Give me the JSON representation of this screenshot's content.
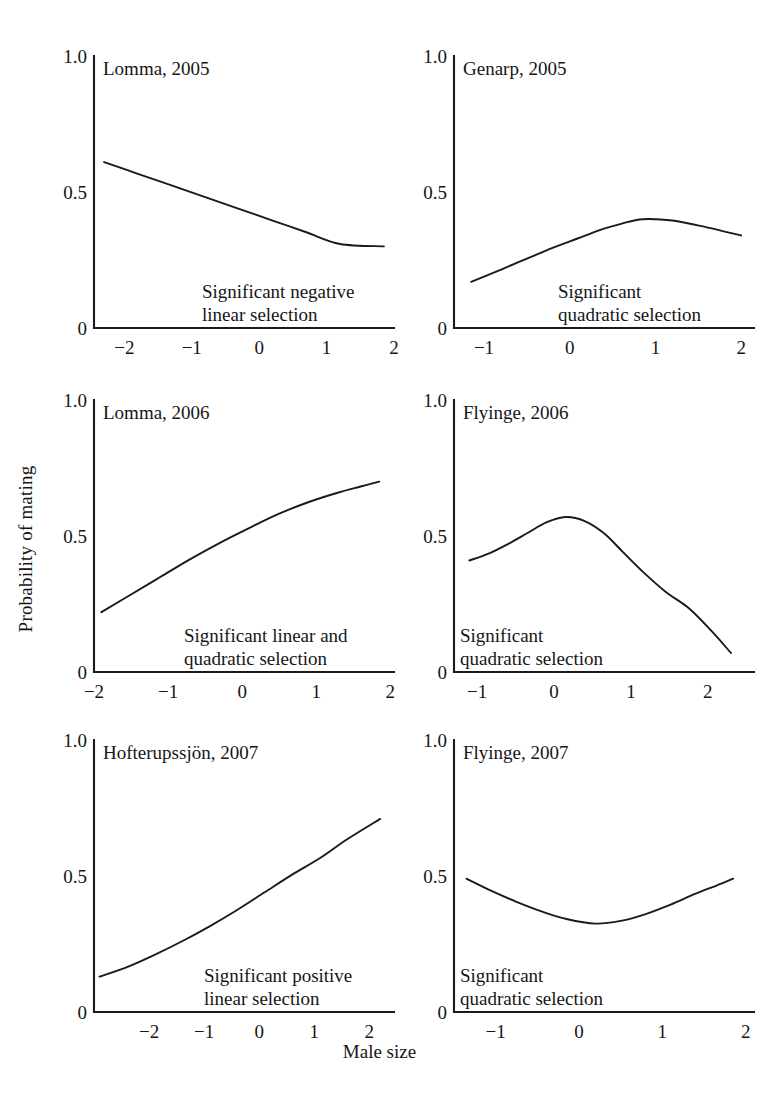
{
  "figure": {
    "y_axis_label": "Probability of mating",
    "x_axis_label": "Male size",
    "line_color": "#1a1a1a",
    "background_color": "#ffffff"
  },
  "chart_data": [
    {
      "type": "line",
      "title": "Lomma, 2005",
      "panel_index": 1,
      "xlabel": "Male size",
      "ylabel": "Probability of mating",
      "xlim": [
        -2.45,
        2.0
      ],
      "ylim": [
        0,
        1.0
      ],
      "xticks": [
        -2,
        -1,
        0,
        1,
        2
      ],
      "xtick_labels": [
        "−2",
        "−1",
        "0",
        "1",
        "2"
      ],
      "yticks": [
        0,
        0.5,
        1.0
      ],
      "ytick_labels": [
        "0",
        "0.5",
        "1.0"
      ],
      "grid": false,
      "legend": "none",
      "annotation": [
        "Significant negative",
        "linear selection"
      ],
      "annotation_align": "left",
      "series": [
        {
          "name": "Probability of mating",
          "x": [
            -2.3,
            -1.8,
            -1.3,
            -0.8,
            -0.3,
            0.2,
            0.7,
            1.2,
            1.85
          ],
          "y": [
            0.61,
            0.567,
            0.524,
            0.481,
            0.438,
            0.395,
            0.352,
            0.309,
            0.3
          ]
        }
      ]
    },
    {
      "type": "line",
      "title": "Genarp, 2005",
      "panel_index": 2,
      "xlabel": "Male size",
      "ylabel": "Probability of mating",
      "xlim": [
        -1.35,
        2.15
      ],
      "ylim": [
        0,
        1.0
      ],
      "xticks": [
        -1,
        0,
        1,
        2
      ],
      "xtick_labels": [
        "−1",
        "0",
        "1",
        "2"
      ],
      "yticks": [
        0,
        0.5,
        1.0
      ],
      "ytick_labels": [
        "0",
        "0.5",
        "1.0"
      ],
      "grid": false,
      "legend": "none",
      "annotation": [
        "Significant",
        "quadratic selection"
      ],
      "annotation_align": "left",
      "series": [
        {
          "name": "Probability of mating",
          "x": [
            -1.15,
            -0.8,
            -0.5,
            -0.2,
            0.1,
            0.4,
            0.6,
            0.85,
            1.2,
            1.6,
            2.0
          ],
          "y": [
            0.17,
            0.215,
            0.255,
            0.295,
            0.33,
            0.365,
            0.383,
            0.4,
            0.395,
            0.37,
            0.34
          ]
        }
      ]
    },
    {
      "type": "line",
      "title": "Lomma, 2006",
      "panel_index": 3,
      "xlabel": "Male size",
      "ylabel": "Probability of mating",
      "xlim": [
        -2.0,
        2.05
      ],
      "ylim": [
        0,
        1.0
      ],
      "xticks": [
        -2,
        -1,
        0,
        1,
        2
      ],
      "xtick_labels": [
        "−2",
        "−1",
        "0",
        "1",
        "2"
      ],
      "yticks": [
        0,
        0.5,
        1.0
      ],
      "ytick_labels": [
        "0",
        "0.5",
        "1.0"
      ],
      "grid": false,
      "legend": "none",
      "annotation": [
        "Significant linear and",
        "quadratic selection"
      ],
      "annotation_align": "left",
      "series": [
        {
          "name": "Probability of mating",
          "x": [
            -1.9,
            -1.5,
            -1.1,
            -0.7,
            -0.3,
            0.1,
            0.5,
            0.9,
            1.3,
            1.6,
            1.85
          ],
          "y": [
            0.22,
            0.285,
            0.35,
            0.415,
            0.475,
            0.53,
            0.582,
            0.625,
            0.66,
            0.682,
            0.7
          ]
        }
      ]
    },
    {
      "type": "line",
      "title": "Flyinge, 2006",
      "panel_index": 4,
      "xlabel": "Male size",
      "ylabel": "Probability of mating",
      "xlim": [
        -1.3,
        2.6
      ],
      "ylim": [
        0,
        1.0
      ],
      "xticks": [
        -1,
        0,
        1,
        2
      ],
      "xtick_labels": [
        "−1",
        "0",
        "1",
        "2"
      ],
      "yticks": [
        0,
        0.5,
        1.0
      ],
      "ytick_labels": [
        "0",
        "0.5",
        "1.0"
      ],
      "grid": false,
      "legend": "none",
      "annotation": [
        "Significant",
        "quadratic selection"
      ],
      "annotation_align": "left",
      "series": [
        {
          "name": "Probability of mating",
          "x": [
            -1.1,
            -0.85,
            -0.6,
            -0.35,
            -0.1,
            0.15,
            0.4,
            0.65,
            0.9,
            1.15,
            1.45,
            1.75,
            2.05,
            2.3
          ],
          "y": [
            0.41,
            0.435,
            0.47,
            0.51,
            0.55,
            0.57,
            0.555,
            0.51,
            0.44,
            0.37,
            0.295,
            0.235,
            0.15,
            0.07
          ]
        }
      ]
    },
    {
      "type": "line",
      "title": "Hofterupssjön, 2007",
      "panel_index": 5,
      "xlabel": "Male size",
      "ylabel": "Probability of mating",
      "xlim": [
        -3.0,
        2.45
      ],
      "ylim": [
        0,
        1.0
      ],
      "xticks": [
        -2,
        -1,
        0,
        1,
        2
      ],
      "xtick_labels": [
        "−2",
        "−1",
        "0",
        "1",
        "2"
      ],
      "yticks": [
        0,
        0.5,
        1.0
      ],
      "ytick_labels": [
        "0",
        "0.5",
        "1.0"
      ],
      "grid": false,
      "legend": "none",
      "annotation": [
        "Significant positive",
        "linear selection"
      ],
      "annotation_align": "left",
      "series": [
        {
          "name": "Probability of mating",
          "x": [
            -2.9,
            -2.4,
            -1.9,
            -1.4,
            -0.9,
            -0.4,
            0.1,
            0.6,
            1.1,
            1.6,
            2.2
          ],
          "y": [
            0.13,
            0.165,
            0.21,
            0.26,
            0.315,
            0.375,
            0.44,
            0.505,
            0.565,
            0.635,
            0.71
          ]
        }
      ]
    },
    {
      "type": "line",
      "title": "Flyinge, 2007",
      "panel_index": 6,
      "xlabel": "Male size",
      "ylabel": "Probability of mating",
      "xlim": [
        -1.5,
        2.1
      ],
      "ylim": [
        0,
        1.0
      ],
      "xticks": [
        -1,
        0,
        1,
        2
      ],
      "xtick_labels": [
        "−1",
        "0",
        "1",
        "2"
      ],
      "yticks": [
        0,
        0.5,
        1.0
      ],
      "ytick_labels": [
        "0",
        "0.5",
        "1.0"
      ],
      "grid": false,
      "legend": "none",
      "annotation": [
        "Significant",
        "quadratic selection"
      ],
      "annotation_align": "left",
      "series": [
        {
          "name": "Probability of mating",
          "x": [
            -1.35,
            -1.05,
            -0.75,
            -0.45,
            -0.15,
            0.2,
            0.5,
            0.8,
            1.1,
            1.4,
            1.65,
            1.85
          ],
          "y": [
            0.49,
            0.445,
            0.405,
            0.37,
            0.342,
            0.325,
            0.335,
            0.36,
            0.395,
            0.435,
            0.465,
            0.49
          ]
        }
      ]
    }
  ]
}
